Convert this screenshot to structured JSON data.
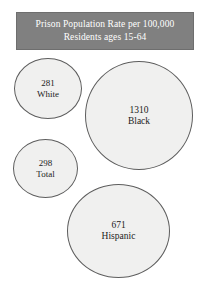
{
  "title": {
    "line1": "Prison Population Rate per 100,000",
    "line2": "Residents ages 15-64"
  },
  "colors": {
    "banner_background": "#808080",
    "banner_text": "#ffffff",
    "bubble_fill": "#f0f0ef",
    "bubble_stroke": "#5d5d5d",
    "page_background": "#ffffff",
    "label_text": "#1b1b1b"
  },
  "bubbles": [
    {
      "value": "281",
      "label": "White"
    },
    {
      "value": "1310",
      "label": "Black"
    },
    {
      "value": "298",
      "label": "Total"
    },
    {
      "value": "671",
      "label": "Hispanic"
    }
  ],
  "chart_data": {
    "type": "bubble",
    "title": "Prison Population Rate per 100,000 Residents ages 15-64",
    "subtitle": "Residents ages 15-64",
    "xlabel": "",
    "ylabel": "",
    "unit": "per 100,000 residents ages 15-64",
    "legend": "none",
    "grid": false,
    "axes": false,
    "size_encoding": "area proportional to value",
    "categories": [
      "White",
      "Black",
      "Total",
      "Hispanic"
    ],
    "values": [
      281,
      1310,
      298,
      671
    ],
    "series": [
      {
        "name": "Prison population rate per 100,000 residents ages 15-64",
        "points": [
          {
            "category": "White",
            "value": 281,
            "bubble_diameter_px": 68
          },
          {
            "category": "Black",
            "value": 1310,
            "bubble_diameter_px": 108
          },
          {
            "category": "Total",
            "value": 298,
            "bubble_diameter_px": 65
          },
          {
            "category": "Hispanic",
            "value": 671,
            "bubble_diameter_px": 103
          }
        ]
      }
    ]
  }
}
